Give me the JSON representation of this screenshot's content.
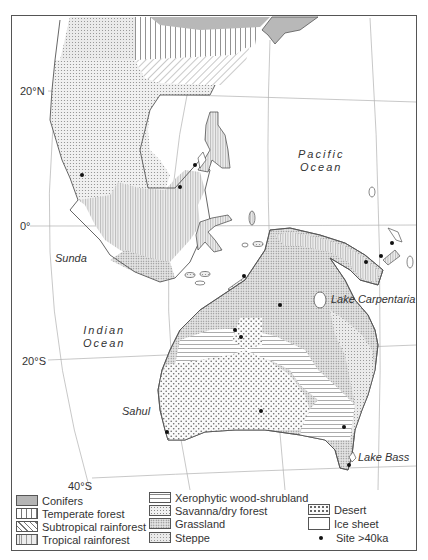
{
  "map": {
    "latitude_labels": {
      "n20": "20°N",
      "eq": "0°",
      "s20": "20°S",
      "s40": "40°S"
    },
    "place_labels": {
      "pacific_ocean_line1": "Pacific",
      "pacific_ocean_line2": "Ocean",
      "indian_ocean_line1": "Indian",
      "indian_ocean_line2": "Ocean",
      "sunda": "Sunda",
      "sahul": "Sahul",
      "lake_carpentaria": "Lake Carpentaria",
      "lake_bass": "Lake Bass"
    }
  },
  "legend": {
    "items": [
      {
        "label": "Conifers",
        "pattern": "solid-gray"
      },
      {
        "label": "Temperate forest",
        "pattern": "vertical-lines"
      },
      {
        "label": "Subtropical rainforest",
        "pattern": "diagonal-lines"
      },
      {
        "label": "Tropical rainforest",
        "pattern": "fine-vertical"
      },
      {
        "label": "Xerophytic wood-shrubland",
        "pattern": "horizontal-lines"
      },
      {
        "label": "Savanna/dry forest",
        "pattern": "fine-dots"
      },
      {
        "label": "Grassland",
        "pattern": "dense-dots"
      },
      {
        "label": "Steppe",
        "pattern": "grid-dots"
      },
      {
        "label": "Desert",
        "pattern": "coarse-dots"
      },
      {
        "label": "Ice sheet",
        "pattern": "white"
      },
      {
        "label": "Site >40ka",
        "pattern": "dot-marker"
      }
    ]
  },
  "colors": {
    "conifers": "#b5b5b5",
    "land_outline": "#555555",
    "grid": "#aaaaaa",
    "site": "#111111"
  }
}
